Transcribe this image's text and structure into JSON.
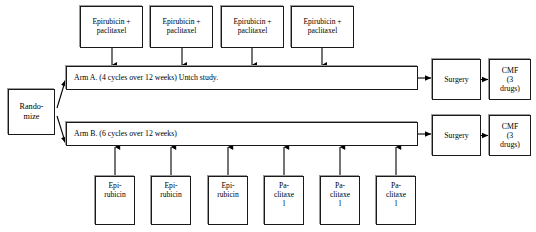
{
  "diagram": {
    "type": "flowchart",
    "colors": {
      "box_border": "#1a1a1a",
      "box_shadow": "#9a9a9a",
      "background": "#ffffff",
      "arrow": "#000000",
      "text": "#000000"
    }
  },
  "randomize": {
    "label": "Rando-\nmize"
  },
  "arm_a": {
    "bar_label": "Arm A.  (4 cycles over 12 weeks)  Untch study.",
    "cycles": 4,
    "weeks": 12,
    "study": "Untch study.",
    "inputs": [
      {
        "label": "Epirubicin +\npaclitaxel"
      },
      {
        "label": "Epirubicin +\npaclitaxel"
      },
      {
        "label": "Epirubicin +\npaclitaxel"
      },
      {
        "label": "Epirubicin +\npaclitaxel"
      }
    ],
    "surgery": {
      "label": "Surgery"
    },
    "cmf": {
      "label": "CMF\n(3\ndrugs)"
    }
  },
  "arm_b": {
    "bar_label": "Arm B.  (6 cycles over 12 weeks)",
    "cycles": 6,
    "weeks": 12,
    "inputs": [
      {
        "label": "Epi-\nrubicin"
      },
      {
        "label": "Epi-\nrubicin"
      },
      {
        "label": "Epi-\nrubicin"
      },
      {
        "label": "Pa-\nclitaxe\nl"
      },
      {
        "label": "Pa-\nclitaxe\nl"
      },
      {
        "label": "Pa-\nclitaxe\nl"
      }
    ],
    "surgery": {
      "label": "Surgery"
    },
    "cmf": {
      "label": "CMF\n(3\ndrugs)"
    }
  }
}
